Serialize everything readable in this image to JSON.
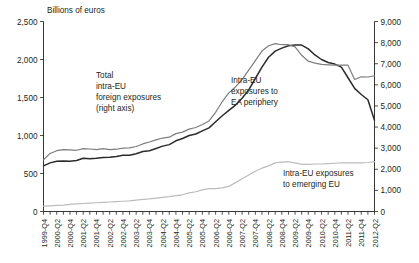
{
  "chart_data": {
    "type": "line",
    "title": "",
    "unit_label": "Billions of euros",
    "xlabel": "",
    "ylabel": "",
    "grid": false,
    "legend_position": "inline-annotations",
    "left_axis": {
      "name": "left",
      "ticks": [
        "0",
        "500",
        "1,000",
        "1,500",
        "2,000",
        "2,500"
      ],
      "tick_values": [
        0,
        500,
        1000,
        1500,
        2000,
        2500
      ],
      "ylim": [
        0,
        2500
      ]
    },
    "right_axis": {
      "name": "right",
      "ticks": [
        "0",
        "1,000",
        "2,000",
        "3,000",
        "4,000",
        "5,000",
        "6,000",
        "7,000",
        "8,000",
        "9,000"
      ],
      "tick_values": [
        0,
        1000,
        2000,
        3000,
        4000,
        5000,
        6000,
        7000,
        8000,
        9000
      ],
      "ylim": [
        0,
        9000
      ]
    },
    "x": [
      "1999-Q4",
      "2000-Q1",
      "2000-Q2",
      "2000-Q3",
      "2000-Q4",
      "2001-Q1",
      "2001-Q2",
      "2001-Q3",
      "2001-Q4",
      "2002-Q1",
      "2002-Q2",
      "2002-Q3",
      "2002-Q4",
      "2003-Q1",
      "2003-Q2",
      "2003-Q3",
      "2003-Q4",
      "2004-Q1",
      "2004-Q2",
      "2004-Q3",
      "2004-Q4",
      "2005-Q1",
      "2005-Q2",
      "2005-Q3",
      "2005-Q4",
      "2006-Q1",
      "2006-Q2",
      "2006-Q3",
      "2006-Q4",
      "2007-Q1",
      "2007-Q2",
      "2007-Q3",
      "2007-Q4",
      "2008-Q1",
      "2008-Q2",
      "2008-Q3",
      "2008-Q4",
      "2009-Q1",
      "2009-Q2",
      "2009-Q3",
      "2009-Q4",
      "2010-Q1",
      "2010-Q2",
      "2010-Q3",
      "2010-Q4",
      "2011-Q1",
      "2011-Q2",
      "2011-Q3",
      "2011-Q4",
      "2012-Q1",
      "2012-Q2"
    ],
    "xtick_labels": [
      "1999-Q4",
      "2000-Q2",
      "2000-Q4",
      "2001-Q2",
      "2001-Q4",
      "2002-Q2",
      "2002-Q4",
      "2003-Q2",
      "2003-Q4",
      "2004-Q2",
      "2004-Q4",
      "2005-Q2",
      "2005-Q4",
      "2006-Q2",
      "2006-Q4",
      "2007-Q2",
      "2007-Q4",
      "2008-Q2",
      "2008-Q4",
      "2009-Q2",
      "2009-Q4",
      "2010-Q2",
      "2010-Q4",
      "2011-Q2",
      "2011-Q4",
      "2012-Q2"
    ],
    "series": [
      {
        "name": "Intra-EU exposures to EA periphery",
        "axis": "left",
        "color": "#2b2b2b",
        "width": 1.5,
        "values": [
          600,
          640,
          660,
          665,
          660,
          670,
          700,
          695,
          700,
          710,
          715,
          725,
          740,
          740,
          760,
          790,
          800,
          830,
          860,
          880,
          930,
          960,
          1000,
          1020,
          1060,
          1100,
          1180,
          1260,
          1330,
          1400,
          1490,
          1600,
          1750,
          1900,
          2030,
          2110,
          2150,
          2180,
          2190,
          2190,
          2140,
          2060,
          2000,
          1960,
          1940,
          1900,
          1760,
          1620,
          1540,
          1470,
          1200
        ]
      },
      {
        "name": "Total intra-EU foreign exposures",
        "axis": "right",
        "color": "#7d7d7d",
        "width": 1.2,
        "values": [
          2450,
          2750,
          2880,
          2930,
          2920,
          2900,
          2980,
          2960,
          2930,
          2980,
          2930,
          2950,
          3000,
          3010,
          3080,
          3200,
          3290,
          3390,
          3480,
          3520,
          3690,
          3760,
          3900,
          3980,
          4120,
          4290,
          4700,
          5200,
          5620,
          5900,
          6250,
          6700,
          7150,
          7600,
          7850,
          7950,
          7900,
          7900,
          7800,
          7400,
          7120,
          7030,
          6970,
          6950,
          6930,
          6930,
          6930,
          6250,
          6380,
          6370,
          6430
        ]
      },
      {
        "name": "Intra-EU exposures to emerging EU",
        "axis": "left",
        "color": "#bcbcbc",
        "width": 1.2,
        "values": [
          70,
          75,
          80,
          85,
          95,
          100,
          105,
          110,
          115,
          120,
          125,
          130,
          135,
          140,
          150,
          160,
          165,
          175,
          185,
          195,
          210,
          220,
          245,
          260,
          285,
          300,
          300,
          310,
          330,
          380,
          430,
          480,
          530,
          570,
          600,
          640,
          650,
          655,
          640,
          620,
          620,
          625,
          625,
          630,
          635,
          640,
          640,
          640,
          640,
          645,
          655
        ]
      }
    ],
    "annotations": [
      {
        "id": "ann-total",
        "lines": [
          "Total",
          "intra-EU",
          "foreign exposures",
          "(right axis)"
        ],
        "x": 96,
        "y": 78
      },
      {
        "id": "ann-periphery",
        "lines": [
          "Intra-EU",
          "exposures to",
          "EA periphery"
        ],
        "x": 231,
        "y": 83
      },
      {
        "id": "ann-emerging",
        "lines": [
          "Intra-EU exposures",
          "to emerging EU"
        ],
        "x": 283,
        "y": 176
      }
    ]
  }
}
